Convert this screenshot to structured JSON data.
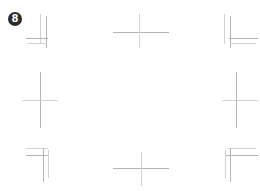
{
  "page": {
    "width": 260,
    "height": 191,
    "background_color": "#fefefe"
  },
  "badge": {
    "label": "8",
    "x": 8,
    "y": 12,
    "size": 14,
    "font_size": 10,
    "fill_color": "#2b2b2b",
    "text_color": "#ffffff"
  },
  "marks": {
    "stroke_colors": {
      "dark": "#9a9a9a",
      "mid": "#b4b4b4",
      "light": "#d2d2d2",
      "faint": "#e2e2e2"
    },
    "items": [
      {
        "name": "corner-mark-top-left",
        "kind": "corner",
        "orientation": "top-left",
        "x": 26,
        "y": 14,
        "w": 40,
        "h": 36
      },
      {
        "name": "cross-mark-top-center",
        "kind": "cross",
        "orientation": "center",
        "x": 113,
        "y": 14,
        "w": 56,
        "h": 34
      },
      {
        "name": "corner-mark-top-right",
        "kind": "corner",
        "orientation": "top-right",
        "x": 216,
        "y": 14,
        "w": 42,
        "h": 36
      },
      {
        "name": "cross-mark-middle-left",
        "kind": "cross",
        "orientation": "center",
        "x": 22,
        "y": 72,
        "w": 40,
        "h": 56
      },
      {
        "name": "cross-mark-middle-right",
        "kind": "cross",
        "orientation": "center",
        "x": 220,
        "y": 72,
        "w": 40,
        "h": 56
      },
      {
        "name": "corner-mark-bottom-left",
        "kind": "corner",
        "orientation": "bottom-left",
        "x": 26,
        "y": 144,
        "w": 40,
        "h": 38
      },
      {
        "name": "cross-mark-bottom-center",
        "kind": "cross",
        "orientation": "center",
        "x": 113,
        "y": 152,
        "w": 56,
        "h": 34
      },
      {
        "name": "corner-mark-bottom-right",
        "kind": "corner",
        "orientation": "bottom-right",
        "x": 216,
        "y": 144,
        "w": 42,
        "h": 38
      }
    ]
  }
}
